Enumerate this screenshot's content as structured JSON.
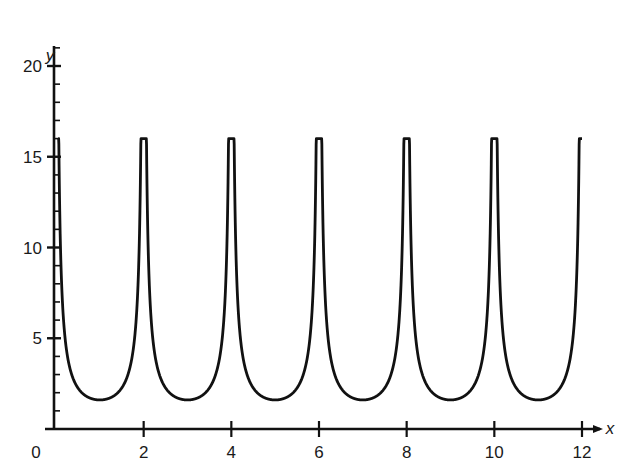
{
  "chart_data": {
    "type": "line",
    "title": "",
    "xlabel": "x",
    "ylabel": "y",
    "xlim": [
      0,
      12.5
    ],
    "ylim": [
      0,
      21
    ],
    "grid": false,
    "legend": null,
    "x_ticks": [
      2,
      4,
      6,
      8,
      10,
      12
    ],
    "x_tick_labels": [
      "2",
      "4",
      "6",
      "8",
      "10",
      "12"
    ],
    "origin_label": "0",
    "y_ticks_major": [
      5,
      10,
      15,
      20
    ],
    "y_tick_labels": [
      "5",
      "10",
      "15",
      "20"
    ],
    "y_minor_tick_step": 1,
    "series": [
      {
        "name": "y = 1.6 csc(πx/2) (clipped at 16)",
        "description": "Periodic U-shaped curve with vertical asymptote-like spikes at even x, minima of ~1.6 at odd x",
        "x": [
          0.1,
          0.25,
          0.5,
          0.75,
          1,
          1.25,
          1.5,
          1.75,
          1.9,
          2,
          2.1,
          2.25,
          2.5,
          2.75,
          3,
          3.25,
          3.5,
          3.75,
          3.9,
          4,
          4.1,
          4.25,
          4.5,
          4.75,
          5,
          5.25,
          5.5,
          5.75,
          5.9,
          6,
          6.1,
          6.25,
          6.5,
          6.75,
          7,
          7.25,
          7.5,
          7.75,
          7.9,
          8,
          8.1,
          8.25,
          8.5,
          8.75,
          9,
          9.25,
          9.5,
          9.75,
          9.9,
          10,
          10.1,
          10.25,
          10.5,
          10.75,
          11,
          11.25,
          11.5,
          11.75,
          11.9,
          12
        ],
        "y": [
          10.2,
          4.2,
          2.3,
          1.7,
          1.6,
          1.7,
          2.3,
          4.2,
          10.2,
          16,
          10.2,
          4.2,
          2.3,
          1.7,
          1.6,
          1.7,
          2.3,
          4.2,
          10.2,
          16,
          10.2,
          4.2,
          2.3,
          1.7,
          1.6,
          1.7,
          2.3,
          4.2,
          10.2,
          16,
          10.2,
          4.2,
          2.3,
          1.7,
          1.6,
          1.7,
          2.3,
          4.2,
          10.2,
          16,
          10.2,
          4.2,
          2.3,
          1.7,
          1.6,
          1.7,
          2.3,
          4.2,
          10.2,
          16,
          10.2,
          4.2,
          2.3,
          1.7,
          1.6,
          1.7,
          2.3,
          4.2,
          10.2,
          16
        ],
        "peaks": [
          {
            "x": 2,
            "y": 16
          },
          {
            "x": 4,
            "y": 16
          },
          {
            "x": 6,
            "y": 16
          },
          {
            "x": 8,
            "y": 16
          },
          {
            "x": 10,
            "y": 16
          },
          {
            "x": 12,
            "y": 16
          }
        ],
        "minima": [
          {
            "x": 1,
            "y": 1.6
          },
          {
            "x": 3,
            "y": 1.6
          },
          {
            "x": 5,
            "y": 1.6
          },
          {
            "x": 7,
            "y": 1.6
          },
          {
            "x": 9,
            "y": 1.6
          },
          {
            "x": 11,
            "y": 1.6
          }
        ],
        "color": "#111111"
      }
    ]
  },
  "style": {
    "line_color": "#111111",
    "axis_color": "#111111",
    "background": "#ffffff"
  }
}
